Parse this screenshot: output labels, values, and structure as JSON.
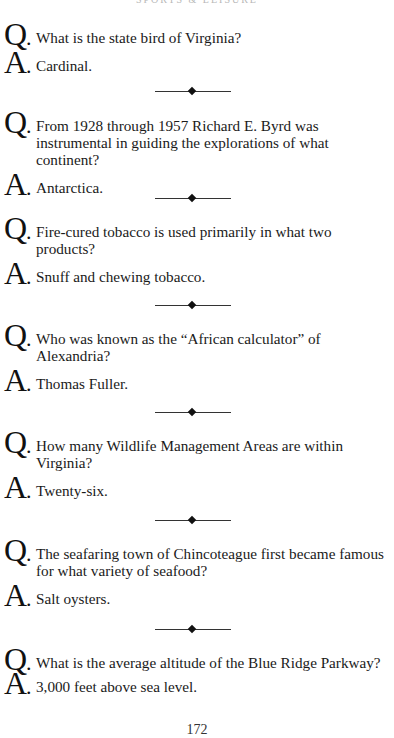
{
  "running_head": "SPORTS & LEISURE",
  "q_label": "Q",
  "a_label": "A",
  "dot": ".",
  "items": [
    {
      "question": "What is the state bird of Virginia?",
      "answer": "Cardinal."
    },
    {
      "question": "From 1928 through 1957 Richard E. Byrd was instrumental in guiding the explorations of what continent?",
      "answer": "Antarctica."
    },
    {
      "question": "Fire-cured tobacco is used primarily in what two products?",
      "answer": "Snuff and chewing tobacco."
    },
    {
      "question": "Who was known as the “African calculator” of Alexandria?",
      "answer": "Thomas Fuller."
    },
    {
      "question": "How many Wildlife Management Areas are within Virginia?",
      "answer": "Twenty-six."
    },
    {
      "question": "The seafaring town of Chincoteague first became famous for what variety of seafood?",
      "answer": "Salt oysters."
    },
    {
      "question": "What is the average altitude of the Blue Ridge Parkway?",
      "answer": "3,000 feet above sea level."
    }
  ],
  "page_number": "172",
  "divider_icon": "diamond-rule-icon"
}
